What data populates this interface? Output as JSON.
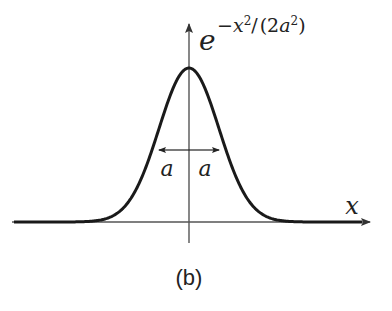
{
  "figure": {
    "caption": "(b)",
    "function_label": {
      "base": "e",
      "exponent_sign": "−",
      "exponent_var": "x",
      "exponent_power": "2",
      "slash": "/",
      "open_paren": "(",
      "coef": "2",
      "param": "a",
      "param_power": "2",
      "close_paren": ")"
    },
    "x_axis_label": "x",
    "width_marker_left": "a",
    "width_marker_right": "a",
    "colors": {
      "curve": "#1a1a1a",
      "axes": "#555555",
      "text": "#222222",
      "background": "#ffffff"
    }
  },
  "chart_data": {
    "type": "line",
    "title": "",
    "function": "exp(-x^2/(2a^2))",
    "xlabel": "x",
    "ylabel": "e^{-x^2/(2a^2)}",
    "annotations": [
      "a",
      "a",
      "(b)"
    ],
    "grid": false,
    "legend": null
  }
}
